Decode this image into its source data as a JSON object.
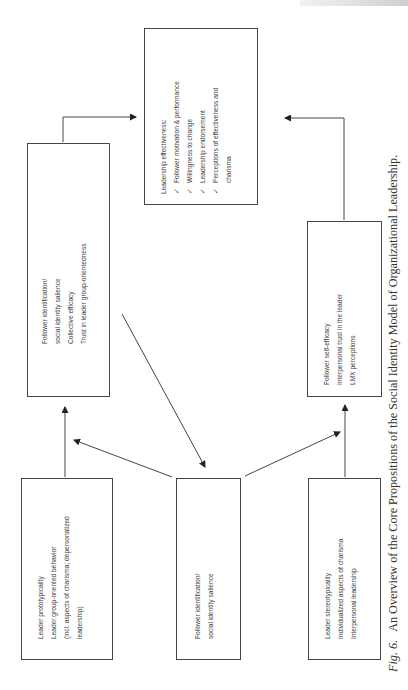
{
  "page": {
    "orientation": "rotated-90-ccw",
    "caption": {
      "figure_label": "Fig. 6.",
      "text": "An Overview of the Core Propositions of the Social Identity Model of Organizational Leadership."
    }
  },
  "diagram": {
    "boxes": {
      "leader_prototypicality": {
        "lines": [
          "Leader prototypicality",
          "Leader group-oriented behavior",
          "(incl. aspects of charisma; depersonalized",
          "leadership)"
        ]
      },
      "follower_identification_input": {
        "lines": [
          "Follower identification/",
          "social identity salience"
        ]
      },
      "leader_stereotypicality": {
        "lines": [
          "Leader stereotypicality",
          "Individualized aspects of charisma",
          "Interpersonal leadership"
        ]
      },
      "group_mediators": {
        "lines": [
          "Follower identification/",
          "social identity salience",
          "Collective efficacy",
          "Trust in leader group-orientedness"
        ]
      },
      "individual_mediators": {
        "lines": [
          "Follower self-efficacy",
          "Interpersonal trust in the leader",
          "LMX perceptions"
        ]
      },
      "leadership_effectiveness": {
        "title": "Leadership effectiveness:",
        "check_glyph": "✓",
        "items": [
          "Follower motivation & performance",
          "Willingness to change",
          "Leadership endorsement",
          "Perceptions of effectiveness and"
        ],
        "continuation": "charisma"
      }
    },
    "arrows": [
      {
        "from": "leader_prototypicality",
        "to": "group_mediators"
      },
      {
        "from": "follower_identification_input",
        "to": "group_mediators"
      },
      {
        "from": "follower_identification_input",
        "to": "individual_mediators"
      },
      {
        "from": "group_mediators",
        "to": "follower_identification_input"
      },
      {
        "from": "leader_stereotypicality",
        "to": "individual_mediators"
      },
      {
        "from": "group_mediators",
        "to": "leadership_effectiveness"
      },
      {
        "from": "individual_mediators",
        "to": "leadership_effectiveness"
      }
    ]
  }
}
